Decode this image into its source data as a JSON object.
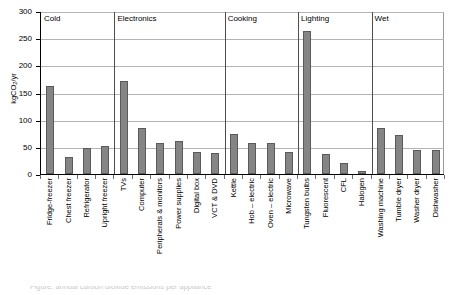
{
  "chart_data": {
    "type": "bar",
    "title": "",
    "xlabel": "",
    "ylabel": "kgCO2/yr",
    "ylabel_html": "kgCO<sub>2</sub>/yr",
    "ylim": [
      0,
      300
    ],
    "yticks": [
      0,
      50,
      100,
      150,
      200,
      250,
      300
    ],
    "ytick_labels": [
      "0",
      "50",
      "100",
      "150",
      "200",
      "250",
      "300"
    ],
    "grid": true,
    "legend": "none",
    "bar_color": "#858585",
    "bar_border_color": "#5a5a5a",
    "gridline_color": "#b4b4b4",
    "axis_color": "#000000",
    "categories": [
      "Fridge-freezer",
      "Chest freezer",
      "Refrigerator",
      "Upright freezer",
      "TVs",
      "Computer",
      "Peripherals & monitors",
      "Power supplies",
      "Digital box",
      "VCT & DVD",
      "Kettle",
      "Hob – electric",
      "Oven – electric",
      "Microwave",
      "Tungsten bulbs",
      "Fluorescent",
      "CFL",
      "Halogen",
      "Washing machine",
      "Tumble dryer",
      "Washer dryer",
      "Dishwasher"
    ],
    "values": [
      162,
      31,
      47,
      51,
      172,
      84,
      58,
      60,
      40,
      39,
      74,
      58,
      58,
      40,
      263,
      37,
      20,
      5,
      85,
      71,
      44,
      44
    ],
    "groups": [
      {
        "label": "Cold",
        "start_index": 0,
        "end_index": 3
      },
      {
        "label": "Electronics",
        "start_index": 4,
        "end_index": 9
      },
      {
        "label": "Cooking",
        "start_index": 10,
        "end_index": 13
      },
      {
        "label": "Lighting",
        "start_index": 14,
        "end_index": 17
      },
      {
        "label": "Wet",
        "start_index": 18,
        "end_index": 21
      }
    ]
  },
  "caption_cut": "Figure: annual carbon dioxide emissions per appliance"
}
